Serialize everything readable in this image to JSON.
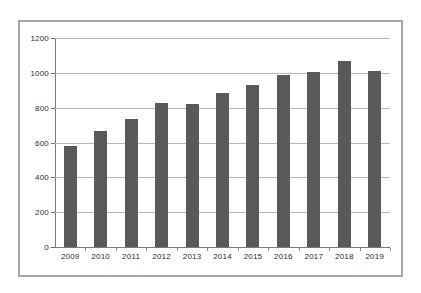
{
  "chart_data": {
    "type": "bar",
    "title": "",
    "subtitle": "",
    "xlabel": "",
    "ylabel": "",
    "categories": [
      "2009",
      "2010",
      "2011",
      "2012",
      "2013",
      "2014",
      "2015",
      "2016",
      "2017",
      "2018",
      "2019"
    ],
    "values": [
      578,
      665,
      735,
      825,
      822,
      885,
      930,
      990,
      1005,
      1070,
      1013
    ],
    "series": [
      {
        "name": "",
        "values": [
          578,
          665,
          735,
          825,
          822,
          885,
          930,
          990,
          1005,
          1070,
          1013
        ]
      }
    ],
    "ylim": [
      0,
      1200
    ],
    "ytick_labels": [
      "0",
      "200",
      "400",
      "600",
      "800",
      "1000",
      "1200"
    ],
    "ytick_values": [
      0,
      200,
      400,
      600,
      800,
      1000,
      1200
    ],
    "xtick_labels": [
      "2009",
      "2010",
      "2011",
      "2012",
      "2013",
      "2014",
      "2015",
      "2016",
      "2017",
      "2018",
      "2019"
    ],
    "grid": true,
    "grid_axis": "y",
    "legend": false,
    "legend_position": "none",
    "bar_color": "#595959",
    "gridline_color": "#b5b5b5",
    "axis_color": "#7a7a7a",
    "frame_color": "#a6a6a6",
    "background_color": "#ffffff",
    "annotations": []
  }
}
